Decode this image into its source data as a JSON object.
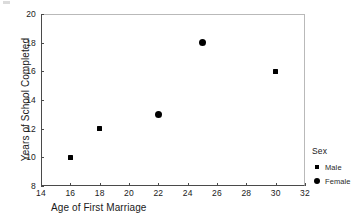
{
  "chart_data": {
    "type": "scatter",
    "title": "",
    "xlabel": "Age of First Marriage",
    "ylabel": "Years of School Completed",
    "xlim": [
      14,
      32
    ],
    "ylim": [
      8,
      20
    ],
    "xticks": [
      14,
      16,
      18,
      20,
      22,
      24,
      26,
      28,
      30,
      32
    ],
    "yticks": [
      8,
      10,
      12,
      14,
      16,
      18,
      20
    ],
    "grid": false,
    "legend": {
      "title": "Sex",
      "position": "right-outside",
      "entries": [
        {
          "label": "Male",
          "marker": "square"
        },
        {
          "label": "Female",
          "marker": "circle"
        }
      ]
    },
    "series": [
      {
        "name": "Male",
        "marker": "square",
        "color": "#000000",
        "points": [
          {
            "x": 16,
            "y": 10
          },
          {
            "x": 18,
            "y": 12
          },
          {
            "x": 30,
            "y": 16
          }
        ]
      },
      {
        "name": "Female",
        "marker": "circle",
        "color": "#000000",
        "points": [
          {
            "x": 22,
            "y": 13
          },
          {
            "x": 25,
            "y": 18
          }
        ]
      }
    ]
  },
  "axis_color": "#4a4a4a",
  "frame_light_color": "#b9b9b9"
}
